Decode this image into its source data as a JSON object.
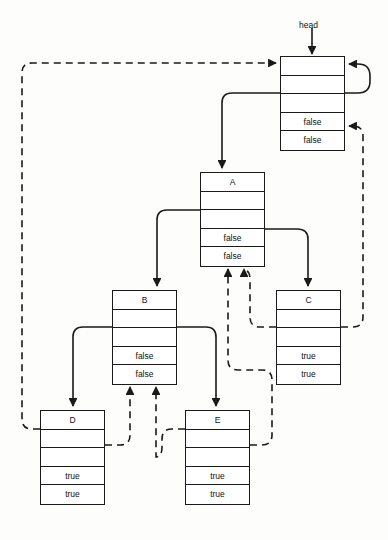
{
  "diagram": {
    "title_label": "head",
    "head_label_pos": {
      "x": 299,
      "y": 20
    },
    "nodes": [
      {
        "id": "head",
        "name": "head-node",
        "x": 280,
        "y": 56,
        "w": 65,
        "cells": [
          "",
          "",
          "",
          "false",
          "false"
        ]
      },
      {
        "id": "A",
        "name": "node-a",
        "x": 200,
        "y": 172,
        "w": 65,
        "cells": [
          "A",
          "",
          "",
          "false",
          "false"
        ]
      },
      {
        "id": "B",
        "name": "node-b",
        "x": 112,
        "y": 290,
        "w": 65,
        "cells": [
          "B",
          "",
          "",
          "false",
          "false"
        ]
      },
      {
        "id": "C",
        "name": "node-c",
        "x": 276,
        "y": 290,
        "w": 65,
        "cells": [
          "C",
          "",
          "",
          "true",
          "true"
        ]
      },
      {
        "id": "D",
        "name": "node-d",
        "x": 40,
        "y": 410,
        "w": 65,
        "cells": [
          "D",
          "",
          "",
          "true",
          "true"
        ]
      },
      {
        "id": "E",
        "name": "node-e",
        "x": 185,
        "y": 410,
        "w": 65,
        "cells": [
          "E",
          "",
          "",
          "true",
          "true"
        ]
      }
    ],
    "edges": [
      {
        "name": "edge-head-entry-arrow",
        "style": "solid",
        "path": "M 312 28 L 312 54"
      },
      {
        "name": "edge-head-self-loop",
        "style": "solid",
        "path": "M 345 93 L 358 93 Q 370 93 370 81 L 370 76 Q 370 64 358 64 L 349 64"
      },
      {
        "name": "edge-head-to-a",
        "style": "solid",
        "path": "M 280 93 L 232 93 Q 222 93 222 103 L 222 168"
      },
      {
        "name": "edge-a-to-b",
        "style": "solid",
        "path": "M 200 210 L 167 210 Q 157 210 157 220 L 157 286"
      },
      {
        "name": "edge-a-to-c",
        "style": "solid",
        "path": "M 265 229 L 297 229 Q 308 229 308 239 L 308 286"
      },
      {
        "name": "edge-b-to-d",
        "style": "solid",
        "path": "M 112 327 L 83 327 Q 73 327 73 337 L 73 406"
      },
      {
        "name": "edge-b-to-e",
        "style": "solid",
        "path": "M 177 327 L 206 327 Q 216 327 216 337 L 216 406"
      },
      {
        "name": "edge-d-to-head",
        "style": "dashed",
        "path": "M 40 429 L 32 429 Q 22 429 22 419 L 22 73 Q 22 63 32 63 L 276 63"
      },
      {
        "name": "edge-c-to-head",
        "style": "dashed",
        "path": "M 341 327 L 353 327 Q 363 327 363 317 L 363 136 Q 363 126 353 126 L 349 126"
      },
      {
        "name": "edge-c-to-a",
        "style": "dashed",
        "path": "M 276 327 L 260 327 Q 250 327 250 317 L 250 280 Q 250 270 244 270 L 244 269"
      },
      {
        "name": "edge-e-to-a",
        "style": "dashed",
        "path": "M 250 445 L 262 445 Q 272 445 272 435 L 272 380 Q 272 370 262 370 L 238 370 Q 228 370 228 360 L 228 269"
      },
      {
        "name": "edge-d-to-b",
        "style": "dashed",
        "path": "M 105 445 L 120 445 Q 130 445 130 435 L 130 387"
      },
      {
        "name": "edge-e-to-b",
        "style": "dashed",
        "path": "M 185 429 L 172 429 Q 162 429 162 439 L 162 447 Q 162 457 156 457 L 156 387"
      }
    ],
    "colors": {
      "stroke": "#1a1a1a",
      "background": "#fdfdfb",
      "node_fill": "#ffffff",
      "text": "#111111"
    }
  }
}
